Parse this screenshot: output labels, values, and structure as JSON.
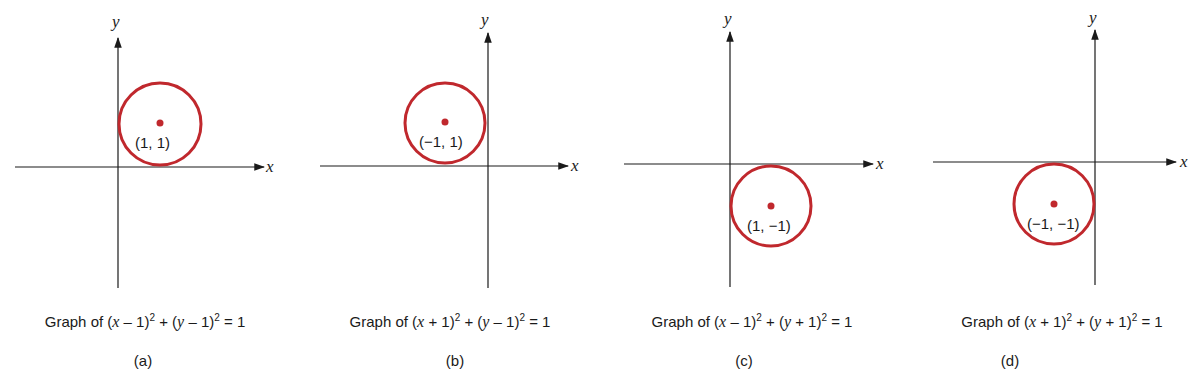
{
  "colors": {
    "circle": "#c0282d",
    "axis": "#1a1a1a"
  },
  "panels": [
    {
      "id": "a",
      "sublabel": "(a)",
      "caption": {
        "prefix": "Graph of ",
        "t1": "(",
        "v1": "x",
        "op1": " – 1)",
        "p1": "2",
        "plus": " + (",
        "v2": "y",
        "op2": " – 1)",
        "p2": "2",
        "eq": " = 1"
      },
      "equation": "(x - 1)^2 + (y - 1)^2 = 1",
      "center_label": "(1, 1)",
      "center": [
        1,
        1
      ],
      "radius": 1,
      "x_label": "x",
      "y_label": "y"
    },
    {
      "id": "b",
      "sublabel": "(b)",
      "caption": {
        "prefix": "Graph of ",
        "t1": "(",
        "v1": "x",
        "op1": " + 1)",
        "p1": "2",
        "plus": " + (",
        "v2": "y",
        "op2": " – 1)",
        "p2": "2",
        "eq": " = 1"
      },
      "equation": "(x + 1)^2 + (y - 1)^2 = 1",
      "center_label": "(−1, 1)",
      "center": [
        -1,
        1
      ],
      "radius": 1,
      "x_label": "x",
      "y_label": "y"
    },
    {
      "id": "c",
      "sublabel": "(c)",
      "caption": {
        "prefix": "Graph of ",
        "t1": "(",
        "v1": "x",
        "op1": " – 1)",
        "p1": "2",
        "plus": " + (",
        "v2": "y",
        "op2": " + 1)",
        "p2": "2",
        "eq": " = 1"
      },
      "equation": "(x - 1)^2 + (y + 1)^2 = 1",
      "center_label": "(1, −1)",
      "center": [
        1,
        -1
      ],
      "radius": 1,
      "x_label": "x",
      "y_label": "y"
    },
    {
      "id": "d",
      "sublabel": "(d)",
      "caption": {
        "prefix": "Graph of ",
        "t1": "(",
        "v1": "x",
        "op1": " + 1)",
        "p1": "2",
        "plus": " + (",
        "v2": "y",
        "op2": " + 1)",
        "p2": "2",
        "eq": " = 1"
      },
      "equation": "(x + 1)^2 + (y + 1)^2 = 1",
      "center_label": "(−1, −1)",
      "center": [
        -1,
        -1
      ],
      "radius": 1,
      "x_label": "x",
      "y_label": "y"
    }
  ]
}
